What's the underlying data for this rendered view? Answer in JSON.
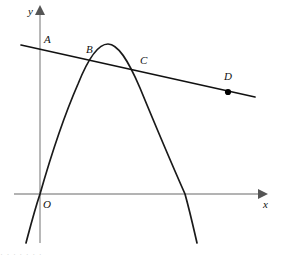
{
  "figure": {
    "kind": "math-diagram",
    "background_color": "#ffffff",
    "axes": {
      "x_axis_label": "x",
      "y_axis_label": "y",
      "origin_label": "O",
      "axis_color": "#9a9a9a",
      "arrow_color": "#555555",
      "x_axis": {
        "x_start": 14,
        "x_end": 266,
        "y": 194
      },
      "y_axis": {
        "x": 40,
        "y_start": 8,
        "y_end": 243
      },
      "origin": {
        "x": 40,
        "y": 194
      },
      "x_label_pos": {
        "x": 265,
        "y": 207
      },
      "y_label_pos": {
        "x": 28,
        "y": 14
      },
      "origin_label_pos": {
        "x": 43,
        "y": 208
      }
    },
    "curve": {
      "name": "parabola",
      "color": "#1a1a1a",
      "stroke_width": 1.7,
      "vertex": {
        "x": 108,
        "y": 44
      },
      "left_root": {
        "x": 40,
        "y": 194
      },
      "right_root": {
        "x": 185,
        "y": 194
      },
      "path": "M 26,243 Q 31,224 40,194 Q 58,132 78,82 Q 94,44 108,44 Q 122,44 140,86 Q 160,134 185,194 Q 191,214 197,243"
    },
    "secant": {
      "name": "line-AD",
      "color": "#111111",
      "stroke_width": 1.7,
      "start": {
        "x": 21,
        "y": 45
      },
      "end": {
        "x": 255,
        "y": 97
      }
    },
    "points": [
      {
        "id": "A",
        "label": "A",
        "x": 40,
        "y": 49,
        "label_x": 44,
        "label_y": 43,
        "marker": false
      },
      {
        "id": "B",
        "label": "B",
        "x": 93,
        "y": 60,
        "label_x": 86,
        "label_y": 53,
        "marker": false
      },
      {
        "id": "C",
        "label": "C",
        "x": 137,
        "y": 69,
        "label_x": 140,
        "label_y": 64,
        "marker": false
      },
      {
        "id": "D",
        "label": "D",
        "x": 228,
        "y": 92,
        "label_x": 224,
        "label_y": 80,
        "marker": true,
        "marker_radius": 3.1
      }
    ]
  },
  "footer": {
    "clipped_text": "·   ·          ·  ·              ·  ·        ·"
  }
}
